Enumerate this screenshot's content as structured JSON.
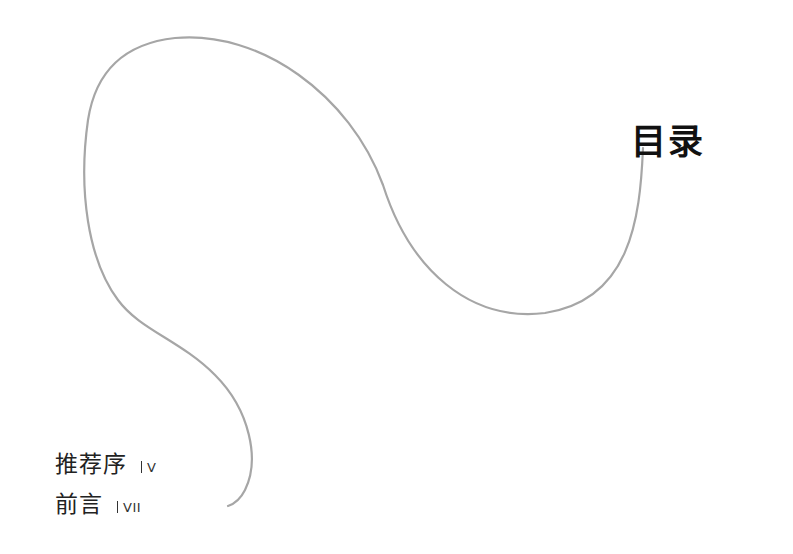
{
  "page": {
    "title": "目录",
    "decoration": {
      "type": "hand-drawn-curve",
      "stroke_color": "#a6a6a6"
    },
    "entries": [
      {
        "title": "推荐序",
        "page": "V"
      },
      {
        "title": "前言",
        "page": "VII"
      }
    ]
  }
}
